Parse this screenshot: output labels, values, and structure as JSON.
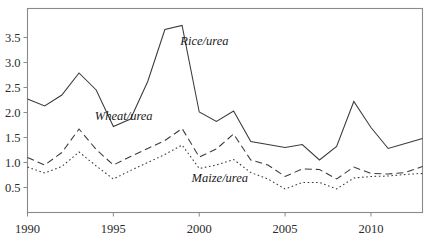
{
  "chart_data": {
    "type": "line",
    "title": "",
    "subtitle": "",
    "xlabel": "",
    "ylabel": "",
    "xlim": [
      1990,
      2013
    ],
    "ylim": [
      0,
      3.8
    ],
    "grid": false,
    "legend_position": "inline-annotations",
    "x": [
      1990,
      1991,
      1992,
      1993,
      1994,
      1995,
      1996,
      1997,
      1998,
      1999,
      2000,
      2001,
      2002,
      2003,
      2004,
      2005,
      2006,
      2007,
      2008,
      2009,
      2010,
      2011,
      2012,
      2013
    ],
    "x_tick_labels": [
      "1990",
      "1995",
      "2000",
      "2005",
      "2010"
    ],
    "x_tick_values": [
      1990,
      1995,
      2000,
      2005,
      2010
    ],
    "y_tick_labels": [
      "0.5",
      "1.0",
      "1.5",
      "2.0",
      "2.5",
      "3.0",
      "3.5"
    ],
    "y_tick_values": [
      0.5,
      1.0,
      1.5,
      2.0,
      2.5,
      3.0,
      3.5
    ],
    "series": [
      {
        "name": "Rice/urea",
        "style": "solid",
        "label": "Rice/urea",
        "label_x": 2000.3,
        "label_y": 3.35,
        "values": [
          2.27,
          2.13,
          2.35,
          2.79,
          2.45,
          1.72,
          1.87,
          2.62,
          3.66,
          3.74,
          2.01,
          1.82,
          2.03,
          1.42,
          1.36,
          1.3,
          1.36,
          1.05,
          1.32,
          2.22,
          1.7,
          1.28,
          1.38,
          1.48
        ]
      },
      {
        "name": "Wheat/urea",
        "style": "dashed",
        "label": "Wheat/urea",
        "label_x": 1995.6,
        "label_y": 1.86,
        "values": [
          1.1,
          0.95,
          1.2,
          1.67,
          1.26,
          0.95,
          1.12,
          1.28,
          1.44,
          1.68,
          1.11,
          1.27,
          1.57,
          1.05,
          0.95,
          0.72,
          0.87,
          0.86,
          0.67,
          0.91,
          0.78,
          0.77,
          0.8,
          0.92
        ]
      },
      {
        "name": "Maize/urea",
        "style": "dotted",
        "label": "Maize/urea",
        "label_x": 2001.2,
        "label_y": 0.62,
        "values": [
          0.91,
          0.79,
          0.92,
          1.21,
          0.93,
          0.67,
          0.84,
          1.0,
          1.16,
          1.35,
          0.88,
          0.95,
          1.06,
          0.8,
          0.67,
          0.47,
          0.6,
          0.6,
          0.47,
          0.69,
          0.72,
          0.73,
          0.76,
          0.78
        ]
      }
    ],
    "colors": {
      "line": "#3a3a3a",
      "axis": "#8a8a8a",
      "text": "#1a1a1a",
      "background": "#ffffff"
    }
  }
}
